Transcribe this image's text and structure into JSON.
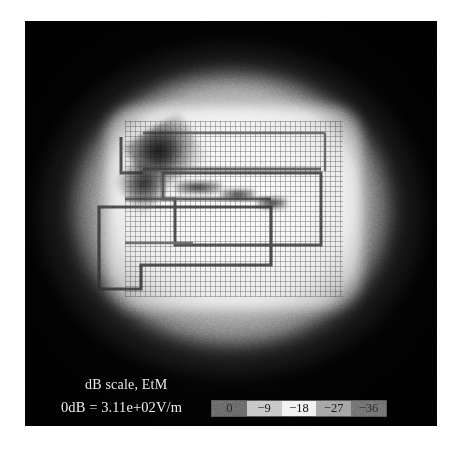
{
  "figure": {
    "type": "em-field-magnitude-plot",
    "caption_line_1": "dB scale, EtM",
    "caption_line_2": "0dB = 3.11e+02V/m",
    "reference_value": "3.11e+02V/m",
    "quantity": "EtM",
    "scale": "dB"
  },
  "chart_data": {
    "type": "heatmap",
    "title": "dB scale, EtM",
    "subtitle": "0dB = 3.11e+02V/m",
    "xlabel": "",
    "ylabel": "",
    "colormap": "grayscale",
    "units": "dB",
    "reference_level_text": "0dB = 3.11e+02V/m",
    "reference_level_value": 311,
    "reference_level_units": "V/m",
    "zlim": [
      -40,
      0
    ],
    "grid": true,
    "legend_position": "bottom",
    "colorbar": {
      "orientation": "horizontal",
      "tick_labels": [
        "0",
        "−9",
        "−18",
        "−27",
        "−36"
      ],
      "tick_values": [
        0,
        -9,
        -18,
        -27,
        -36
      ],
      "cell_fills": [
        "#6e6e6e",
        "#c9c9c9",
        "#f2f2f2",
        "#a8a8a8",
        "#777777"
      ],
      "label_colors": [
        "#2a2a2a",
        "#1a1a1a",
        "#101010",
        "#202020",
        "#2a2a2a"
      ]
    }
  },
  "colors": {
    "plot_background": "#050505",
    "field_peak": "#fbfbfb",
    "trace_dark": "#2a2a2a",
    "page_background": "#ffffff"
  }
}
